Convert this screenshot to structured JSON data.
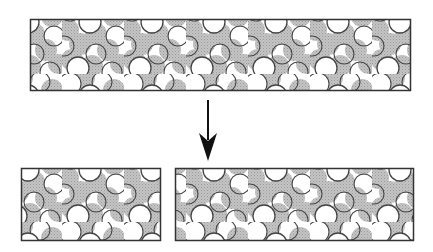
{
  "diagram": {
    "colors": {
      "background": "#ffffff",
      "border": "#333333",
      "filled_particle": "#bdbdbd",
      "filled_particle_stipple": "#9a9a9a",
      "open_particle_stroke": "#444444",
      "open_particle_fill": "#ffffff",
      "arrow": "#111111"
    },
    "blocks": [
      {
        "id": "original-block",
        "x": 30,
        "y": 19,
        "width": 381,
        "height": 72
      },
      {
        "id": "split-block-left",
        "x": 21,
        "y": 168,
        "width": 140,
        "height": 73
      },
      {
        "id": "split-block-right",
        "x": 175,
        "y": 168,
        "width": 239,
        "height": 73
      }
    ],
    "arrow": {
      "x": 208,
      "y1": 100,
      "y2": 161,
      "direction": "down"
    },
    "legend": []
  }
}
